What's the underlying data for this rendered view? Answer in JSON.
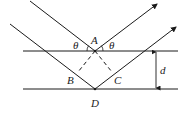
{
  "diagram": {
    "type": "bragg-diffraction",
    "labels": {
      "A": "A",
      "B": "B",
      "C": "C",
      "D": "D",
      "d": "d",
      "theta_left": "θ",
      "theta_right": "θ"
    },
    "colors": {
      "line": "#1a1a1a",
      "background": "#ffffff"
    }
  }
}
